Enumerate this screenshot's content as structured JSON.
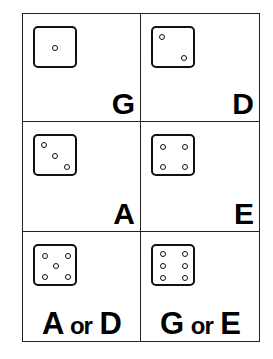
{
  "cells": [
    {
      "die_value": 1,
      "label": "G"
    },
    {
      "die_value": 2,
      "label": "D"
    },
    {
      "die_value": 3,
      "label": "A"
    },
    {
      "die_value": 4,
      "label": "E"
    },
    {
      "die_value": 5,
      "label_parts": [
        "A",
        "or",
        "D"
      ]
    },
    {
      "die_value": 6,
      "label_parts": [
        "G",
        "or",
        "E"
      ]
    }
  ]
}
